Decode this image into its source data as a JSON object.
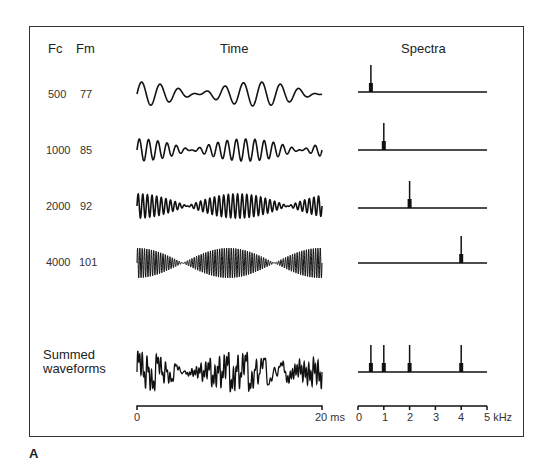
{
  "figure": {
    "panel_label": "A",
    "headers": {
      "fc": "Fc",
      "fm": "Fm",
      "time": "Time",
      "spectra": "Spectra"
    },
    "rows": [
      {
        "fc": "500",
        "fm": "77"
      },
      {
        "fc": "1000",
        "fm": "85"
      },
      {
        "fc": "2000",
        "fm": "92"
      },
      {
        "fc": "4000",
        "fm": "101"
      }
    ],
    "summed_label_line1": "Summed",
    "summed_label_line2": "waveforms",
    "time_axis": {
      "start": "0",
      "end": "20 ms"
    },
    "freq_axis": {
      "ticks": [
        "0",
        "1",
        "2",
        "3",
        "4",
        "5 kHz"
      ]
    }
  },
  "chart_data": {
    "type": "line",
    "columns": [
      "Fc",
      "Fm",
      "Time",
      "Spectra"
    ],
    "series": [
      {
        "name": "Fc 500 / Fm 77",
        "carrier_hz": 500,
        "modulation_hz": 77,
        "spectral_peak_khz": 0.5
      },
      {
        "name": "Fc 1000 / Fm 85",
        "carrier_hz": 1000,
        "modulation_hz": 85,
        "spectral_peak_khz": 1
      },
      {
        "name": "Fc 2000 / Fm 92",
        "carrier_hz": 2000,
        "modulation_hz": 92,
        "spectral_peak_khz": 2
      },
      {
        "name": "Fc 4000 / Fm 101",
        "carrier_hz": 4000,
        "modulation_hz": 101,
        "spectral_peak_khz": 4
      },
      {
        "name": "Summed waveforms",
        "spectral_peaks_khz": [
          0.5,
          1,
          2,
          4
        ]
      }
    ],
    "time_axis": {
      "label": "ms",
      "range": [
        0,
        20
      ]
    },
    "freq_axis": {
      "label": "kHz",
      "range": [
        0,
        5
      ],
      "ticks": [
        0,
        1,
        2,
        3,
        4,
        5
      ]
    },
    "grid": false
  }
}
